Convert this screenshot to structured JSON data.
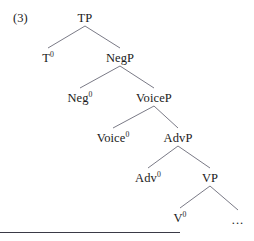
{
  "figure": {
    "example_number": "(3)",
    "ellipsis": "...",
    "line_color": "#6b6b78",
    "text_color": "#1a1a1a",
    "rule_color": "#3a3a46"
  },
  "tree": {
    "nodes": [
      {
        "id": "tp",
        "label": "TP",
        "superscript": "",
        "x": 85,
        "y": 12
      },
      {
        "id": "t0",
        "label": "T",
        "superscript": "0",
        "x": 48,
        "y": 52
      },
      {
        "id": "negp",
        "label": "NegP",
        "superscript": "",
        "x": 120,
        "y": 52
      },
      {
        "id": "neg0",
        "label": "Neg",
        "superscript": "0",
        "x": 80,
        "y": 92
      },
      {
        "id": "voicep",
        "label": "VoiceP",
        "superscript": "",
        "x": 154,
        "y": 92
      },
      {
        "id": "voice0",
        "label": "Voice",
        "superscript": "0",
        "x": 113,
        "y": 132
      },
      {
        "id": "advp",
        "label": "AdvP",
        "superscript": "",
        "x": 178,
        "y": 132
      },
      {
        "id": "adv0",
        "label": "Adv",
        "superscript": "0",
        "x": 148,
        "y": 172
      },
      {
        "id": "vp",
        "label": "VP",
        "superscript": "",
        "x": 210,
        "y": 172
      },
      {
        "id": "v0",
        "label": "V",
        "superscript": "0",
        "x": 180,
        "y": 212
      },
      {
        "id": "dots",
        "label": "...",
        "superscript": "",
        "x": 238,
        "y": 214
      }
    ],
    "branches": [
      {
        "parent": "tp",
        "children": [
          "t0",
          "negp"
        ]
      },
      {
        "parent": "negp",
        "children": [
          "neg0",
          "voicep"
        ]
      },
      {
        "parent": "voicep",
        "children": [
          "voice0",
          "advp"
        ]
      },
      {
        "parent": "advp",
        "children": [
          "adv0",
          "vp"
        ]
      },
      {
        "parent": "vp",
        "children": [
          "v0",
          "dots"
        ]
      }
    ]
  }
}
